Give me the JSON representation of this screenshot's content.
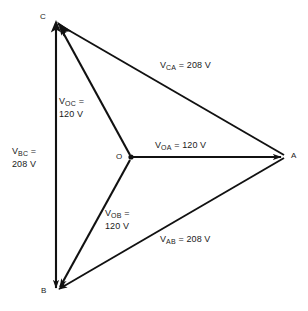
{
  "diagram": {
    "type": "three-phase-phasor-diagram",
    "title": "",
    "line_color": "#111111",
    "text_color": "#1a1a1a",
    "background": "#ffffff",
    "nodes": [
      {
        "id": "A",
        "label": "A",
        "x": 285,
        "y": 156
      },
      {
        "id": "B",
        "label": "B",
        "x": 56,
        "y": 292
      },
      {
        "id": "C",
        "label": "C",
        "x": 56,
        "y": 22
      },
      {
        "id": "O",
        "label": "O",
        "x": 131,
        "y": 157
      }
    ],
    "vectors": [
      {
        "id": "OA",
        "from": "O",
        "to": "A",
        "symbol": "V",
        "subscript": "OA",
        "equals": "=",
        "value": "120",
        "unit": "V",
        "label_text": "V OA = 120 V",
        "lines": [
          "V_OA = 120 V"
        ]
      },
      {
        "id": "OB",
        "from": "O",
        "to": "B",
        "symbol": "V",
        "subscript": "OB",
        "equals": "=",
        "value": "120",
        "unit": "V",
        "label_text": "V OB = 120 V",
        "lines": [
          "V_OB =",
          "120 V"
        ]
      },
      {
        "id": "OC",
        "from": "O",
        "to": "C",
        "symbol": "V",
        "subscript": "OC",
        "equals": "=",
        "value": "120",
        "unit": "V",
        "label_text": "V OC = 120 V",
        "lines": [
          "V_OC =",
          "120 V"
        ]
      },
      {
        "id": "CA",
        "from": "C",
        "to": "A",
        "symbol": "V",
        "subscript": "CA",
        "equals": "=",
        "value": "208",
        "unit": "V",
        "label_text": "V CA = 208 V",
        "lines": [
          "V_CA = 208 V"
        ]
      },
      {
        "id": "AB",
        "from": "A",
        "to": "B",
        "symbol": "V",
        "subscript": "AB",
        "equals": "=",
        "value": "208",
        "unit": "V",
        "label_text": "V AB = 208 V",
        "lines": [
          "V_AB = 208 V"
        ]
      },
      {
        "id": "BC",
        "from": "B",
        "to": "C",
        "symbol": "V",
        "subscript": "BC",
        "equals": "=",
        "value": "208",
        "unit": "V",
        "label_text": "V BC = 208 V",
        "lines": [
          "V_BC =",
          "208 V"
        ]
      }
    ],
    "labels": {
      "v_symbol": "V",
      "equals_sign": "=",
      "unit": "V",
      "sub_oa": "OA",
      "sub_ob": "OB",
      "sub_oc": "OC",
      "sub_ca": "CA",
      "sub_ab": "AB",
      "sub_bc": "BC",
      "val_120": "120 V",
      "val_208": "208 V",
      "val_120_inline": "= 120 V",
      "val_208_inline": "= 208 V"
    },
    "node_labels": {
      "a": "A",
      "b": "B",
      "c": "C",
      "o": "O"
    }
  }
}
